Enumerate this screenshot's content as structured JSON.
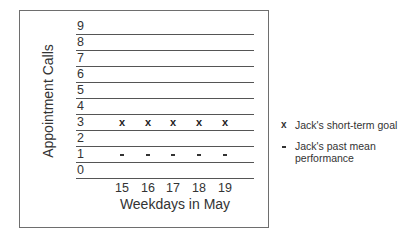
{
  "chart_data": {
    "type": "scatter",
    "title": "",
    "xlabel": "Weekdays in May",
    "ylabel": "Appointment Calls",
    "categories": [
      "15",
      "16",
      "17",
      "18",
      "19"
    ],
    "y_ticks": [
      "0",
      "1",
      "2",
      "3",
      "4",
      "5",
      "6",
      "7",
      "8",
      "9"
    ],
    "ylim": [
      0,
      9
    ],
    "grid": true,
    "legend_position": "right",
    "series": [
      {
        "name": "Jack's short-term goal",
        "marker": "x",
        "values": [
          3,
          3,
          3,
          3,
          3
        ]
      },
      {
        "name": "Jack's past mean performance",
        "marker": "-",
        "values": [
          1,
          1,
          1,
          1,
          1
        ]
      }
    ]
  },
  "legend": {
    "goal": {
      "symbol": "x",
      "label": "Jack's short-term goal"
    },
    "past": {
      "symbol": "-",
      "label_line1": "Jack's past mean",
      "label_line2": "performance"
    }
  }
}
